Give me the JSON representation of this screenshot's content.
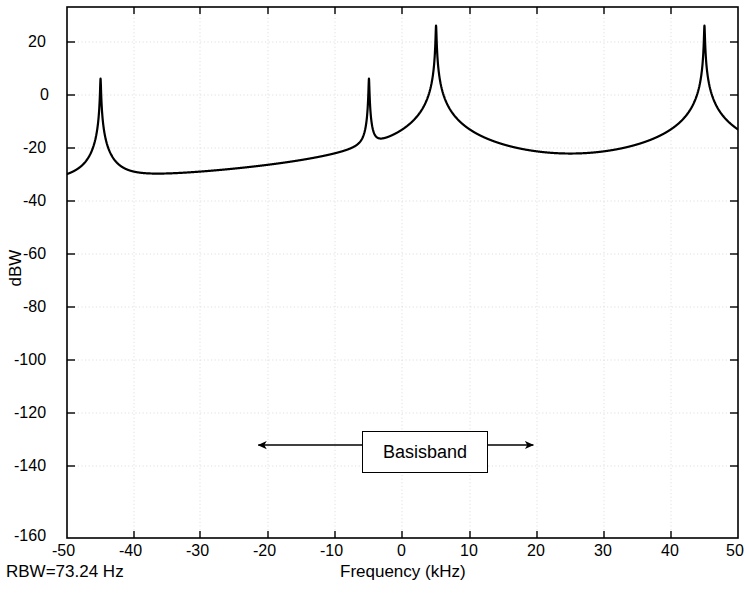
{
  "chart_data": {
    "type": "line",
    "title": "",
    "xlabel": "Frequency (kHz)",
    "ylabel": "dBW",
    "xlim": [
      -50,
      50
    ],
    "ylim": [
      -180,
      20
    ],
    "xticks": [
      -50,
      -40,
      -30,
      -20,
      -10,
      0,
      10,
      20,
      30,
      40,
      50
    ],
    "yticks": [
      20,
      0,
      -20,
      -40,
      -60,
      -80,
      -100,
      -120,
      -140,
      -160,
      -180
    ],
    "xtick_labels": [
      "-50",
      "-40",
      "-30",
      "-20",
      "-10",
      "0",
      "10",
      "20",
      "30",
      "40",
      "50"
    ],
    "ytick_labels": [
      "20",
      "0",
      "-20",
      "-40",
      "-60",
      "-80",
      "-100",
      "-120",
      "-140",
      "-160",
      "-180"
    ],
    "grid": true,
    "legend": null,
    "line_color": "#000000",
    "series": [
      {
        "name": "spectrum",
        "peaks": [
          {
            "x": -45,
            "y": -7
          },
          {
            "x": -5,
            "y": -7
          },
          {
            "x": 5,
            "y": 13
          },
          {
            "x": 45,
            "y": 13
          }
        ],
        "troughs": [
          {
            "x": -50,
            "y": -119
          },
          {
            "x": -47.8,
            "y": -122
          },
          {
            "x": -25,
            "y": -159
          },
          {
            "x": -2.2,
            "y": -122
          },
          {
            "x": 0,
            "y": -121
          },
          {
            "x": 25,
            "y": -150
          },
          {
            "x": 50,
            "y": -119
          }
        ]
      }
    ],
    "annotations": [
      {
        "name": "basisband-span",
        "label": "Basisband",
        "arrow_type": "double-headed",
        "arrow_x_start": -21.5,
        "arrow_x_end": 19.5,
        "arrow_y": -145
      }
    ],
    "footnote": "RBW=73.24 Hz"
  },
  "axes": {
    "ylabel": "dBW",
    "xlabel": "Frequency (kHz)"
  },
  "footer": {
    "rbw": "RBW=73.24 Hz"
  },
  "annotation": {
    "basisband_label": "Basisband"
  },
  "ticks": {
    "x": [
      "-50",
      "-40",
      "-30",
      "-20",
      "-10",
      "0",
      "10",
      "20",
      "30",
      "40",
      "50"
    ],
    "y": [
      "20",
      "0",
      "-20",
      "-40",
      "-60",
      "-80",
      "-100",
      "-120",
      "-140",
      "-160",
      "-180"
    ]
  }
}
